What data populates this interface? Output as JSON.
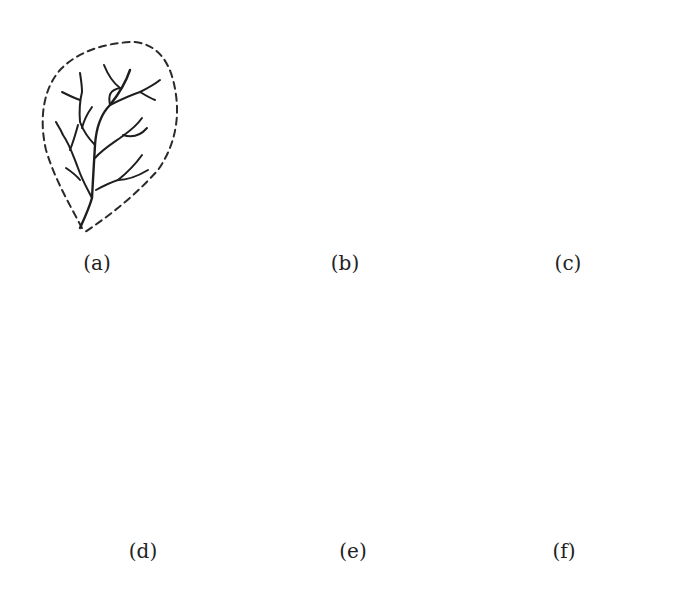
{
  "figure": {
    "panels": [
      {
        "id": "a",
        "label": "(a)",
        "pattern": "dendritic-elongated",
        "boundary": "dashed",
        "label_pos": [
          97,
          265
        ]
      },
      {
        "id": "b",
        "label": "(b)",
        "pattern": "dendritic-fan",
        "boundary": "dashed",
        "label_pos": [
          345,
          265
        ]
      },
      {
        "id": "c",
        "label": "(c)",
        "pattern": "radial-centripetal",
        "boundary": "dashed",
        "label_pos": [
          568,
          265
        ]
      },
      {
        "id": "d",
        "label": "(d)",
        "pattern": "trellis-converging",
        "boundary": "dashed",
        "label_pos": [
          143,
          553
        ]
      },
      {
        "id": "e",
        "label": "(e)",
        "pattern": "rectangular",
        "boundary": "dashed",
        "label_pos": [
          353,
          553
        ]
      },
      {
        "id": "f",
        "label": "(f)",
        "pattern": "radial-annular",
        "boundary": "solid",
        "label_pos": [
          564,
          553
        ]
      }
    ]
  },
  "colors": {
    "background": "#ffffff",
    "line": "#1e1e1e"
  }
}
